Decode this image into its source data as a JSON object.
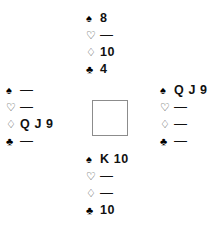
{
  "diagram": {
    "background_color": "#ffffff",
    "center_square": {
      "label": "",
      "border_color": "#8c8c8c",
      "fill_color": "#ffffff"
    },
    "void_marker": "—",
    "suit_symbols": {
      "spade": "♠",
      "heart": "♡",
      "diamond": "♢",
      "club": "♣"
    },
    "hands": {
      "north": {
        "position_label": "North",
        "suits": [
          {
            "suit": "spade",
            "symbol": "♠",
            "filled": true,
            "cards": "8"
          },
          {
            "suit": "heart",
            "symbol": "♡",
            "filled": false,
            "cards": "—"
          },
          {
            "suit": "diamond",
            "symbol": "♢",
            "filled": false,
            "cards": "10"
          },
          {
            "suit": "club",
            "symbol": "♣",
            "filled": true,
            "cards": "4"
          }
        ]
      },
      "west": {
        "position_label": "West",
        "suits": [
          {
            "suit": "spade",
            "symbol": "♠",
            "filled": true,
            "cards": "—"
          },
          {
            "suit": "heart",
            "symbol": "♡",
            "filled": false,
            "cards": "—"
          },
          {
            "suit": "diamond",
            "symbol": "♢",
            "filled": false,
            "cards": "Q J 9"
          },
          {
            "suit": "club",
            "symbol": "♣",
            "filled": true,
            "cards": "—"
          }
        ]
      },
      "east": {
        "position_label": "East",
        "suits": [
          {
            "suit": "spade",
            "symbol": "♠",
            "filled": true,
            "cards": "Q J 9"
          },
          {
            "suit": "heart",
            "symbol": "♡",
            "filled": false,
            "cards": "—"
          },
          {
            "suit": "diamond",
            "symbol": "♢",
            "filled": false,
            "cards": "—"
          },
          {
            "suit": "club",
            "symbol": "♣",
            "filled": true,
            "cards": "—"
          }
        ]
      },
      "south": {
        "position_label": "South",
        "suits": [
          {
            "suit": "spade",
            "symbol": "♠",
            "filled": true,
            "cards": "K 10"
          },
          {
            "suit": "heart",
            "symbol": "♡",
            "filled": false,
            "cards": "—"
          },
          {
            "suit": "diamond",
            "symbol": "♢",
            "filled": false,
            "cards": "—"
          },
          {
            "suit": "club",
            "symbol": "♣",
            "filled": true,
            "cards": "10"
          }
        ]
      }
    }
  }
}
